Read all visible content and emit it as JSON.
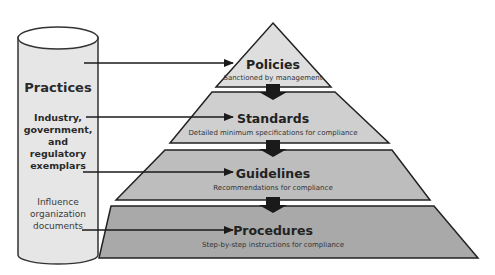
{
  "colors": {
    "background": "#ffffff",
    "cylinder_fill": "#e6e6e6",
    "cylinder_stroke": "#333333",
    "tier_1": "#dedede",
    "tier_2": "#cfcfcf",
    "tier_3": "#bdbdbd",
    "tier_4": "#a9a9a9",
    "stroke": "#222222",
    "connector": "#1a1a1a"
  },
  "cylinder": {
    "title": "Practices",
    "group_1": [
      "Industry,",
      "government,",
      "and",
      "regulatory",
      "exemplars"
    ],
    "group_2": [
      "Influence",
      "organization",
      "documents"
    ]
  },
  "pyramid": {
    "tiers": [
      {
        "title": "Policies",
        "subtitle": "Sanctioned by management"
      },
      {
        "title": "Standards",
        "subtitle": "Detailed minimum specifications for compliance"
      },
      {
        "title": "Guidelines",
        "subtitle": "Recommendations for compliance"
      },
      {
        "title": "Procedures",
        "subtitle": "Step-by-step instructions for compliance"
      }
    ]
  }
}
